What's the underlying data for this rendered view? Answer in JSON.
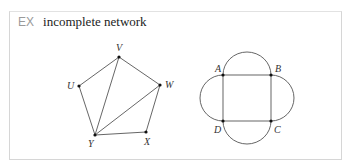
{
  "header": {
    "tag": "EX",
    "title": "incomplete network"
  },
  "graph1": {
    "labels": {
      "V": "V",
      "U": "U",
      "W": "W",
      "Y": "Y",
      "X": "X"
    }
  },
  "graph2": {
    "labels": {
      "A": "A",
      "B": "B",
      "C": "C",
      "D": "D"
    }
  },
  "colors": {
    "line": "#555555",
    "border": "#d6d6d6",
    "tag": "#9a9a9a"
  }
}
